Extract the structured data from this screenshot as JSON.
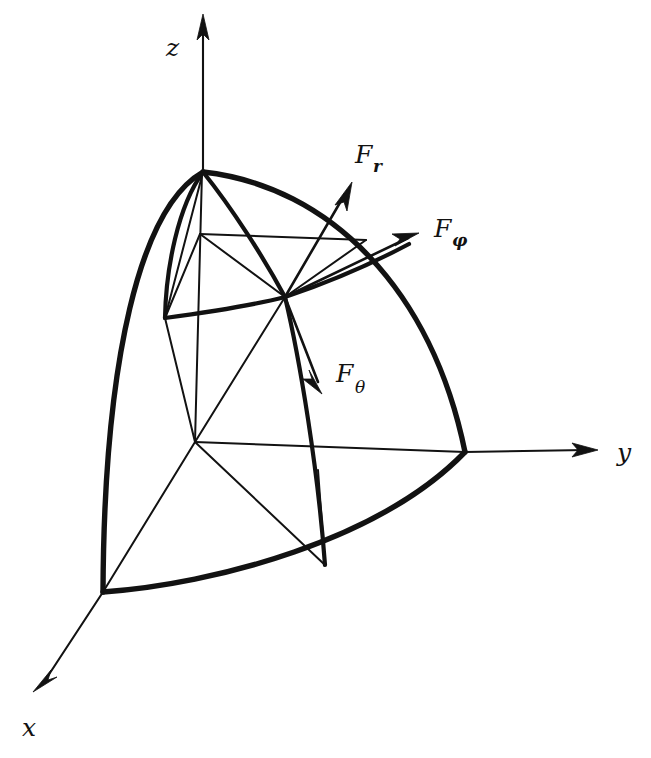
{
  "figure": {
    "background_color": "#ffffff",
    "ink_color": "#121212",
    "width": 651,
    "height": 758
  },
  "axes": [
    {
      "id": "z",
      "label": "z",
      "label_x": 166,
      "label_y": 56,
      "direction": "up",
      "origin": [
        195,
        442
      ],
      "tip": [
        203,
        16
      ]
    },
    {
      "id": "y",
      "label": "y",
      "label_x": 617,
      "label_y": 461,
      "direction": "right",
      "origin": [
        195,
        442
      ],
      "tip": [
        598,
        450
      ]
    },
    {
      "id": "x",
      "label": "x",
      "label_x": 22,
      "label_y": 736,
      "direction": "down-left",
      "origin": [
        195,
        442
      ],
      "tip": [
        33,
        692
      ]
    }
  ],
  "vectors": [
    {
      "id": "F_r",
      "base": "F",
      "subscript": "r",
      "subscript_bold": true,
      "label_x": 355,
      "label_y": 163,
      "sub_dx": 18,
      "sub_dy": 9,
      "from": [
        285,
        297
      ],
      "to": [
        352,
        182
      ],
      "description": "radial force component, points outward along r"
    },
    {
      "id": "F_phi",
      "base": "F",
      "subscript": "φ",
      "subscript_bold": true,
      "label_x": 434,
      "label_y": 237,
      "sub_dx": 18,
      "sub_dy": 9,
      "from": [
        285,
        297
      ],
      "to": [
        419,
        233
      ],
      "description": "azimuthal force component, tangent to latitude circle"
    },
    {
      "id": "F_theta",
      "base": "F",
      "subscript": "θ",
      "subscript_bold": false,
      "label_x": 336,
      "label_y": 382,
      "sub_dx": 19,
      "sub_dy": 11,
      "from": [
        285,
        297
      ],
      "to": [
        322,
        394
      ],
      "description": "polar force component, tangent to meridian"
    }
  ],
  "points": {
    "origin": [
      195,
      442
    ],
    "pole": [
      203,
      172
    ],
    "point_p": [
      285,
      297
    ],
    "x_axis_sphere": [
      103,
      592
    ],
    "y_axis_sphere": [
      465,
      452
    ],
    "inner_chord_left": [
      200,
      234
    ],
    "inner_chord_right": [
      366,
      240
    ],
    "inner_arc_left": [
      165,
      318
    ],
    "equator_mid": [
      325,
      565
    ]
  },
  "surfaces": {
    "outer_sphere_note": "Spherical octant wedge bounded by two meridian arcs and one equatorial arc",
    "inner_sphere_note": "Smaller radius octant wedge nested inside"
  }
}
